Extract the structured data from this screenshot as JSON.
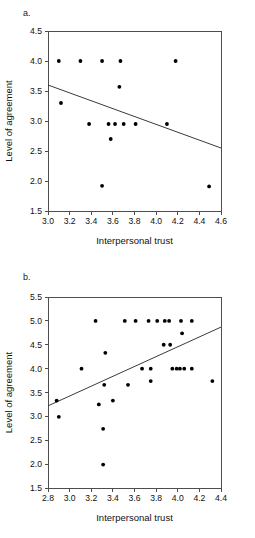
{
  "figure": {
    "panels": [
      {
        "label": "a.",
        "xlabel": "Interpersonal trust",
        "ylabel": "Level of agreement"
      },
      {
        "label": "b.",
        "xlabel": "Interpersonal trust",
        "ylabel": "Level of agreement"
      }
    ]
  },
  "chart_data": [
    {
      "type": "scatter",
      "title": "a.",
      "xlabel": "Interpersonal trust",
      "ylabel": "Level of agreement",
      "xlim": [
        3.0,
        4.6
      ],
      "ylim": [
        1.5,
        4.5
      ],
      "xticks": [
        "3.0",
        "3.2",
        "3.4",
        "3.6",
        "3.8",
        "4.0",
        "4.2",
        "4.4",
        "4.6"
      ],
      "yticks": [
        "1.5",
        "2.0",
        "2.5",
        "3.0",
        "3.5",
        "4.0",
        "4.5"
      ],
      "xtick_values": [
        3.0,
        3.2,
        3.4,
        3.6,
        3.8,
        4.0,
        4.2,
        4.4,
        4.6
      ],
      "ytick_values": [
        1.5,
        2.0,
        2.5,
        3.0,
        3.5,
        4.0,
        4.5
      ],
      "grid": false,
      "legend": false,
      "points": [
        [
          3.1,
          4.0
        ],
        [
          3.3,
          4.0
        ],
        [
          3.5,
          4.0
        ],
        [
          3.67,
          4.0
        ],
        [
          4.18,
          4.0
        ],
        [
          3.66,
          3.57
        ],
        [
          3.12,
          3.3
        ],
        [
          3.38,
          2.95
        ],
        [
          3.56,
          2.95
        ],
        [
          3.62,
          2.95
        ],
        [
          3.7,
          2.95
        ],
        [
          3.81,
          2.95
        ],
        [
          4.1,
          2.95
        ],
        [
          3.58,
          2.7
        ],
        [
          3.5,
          1.92
        ],
        [
          4.49,
          1.91
        ]
      ],
      "trend_line": {
        "x0": 3.0,
        "y0": 3.6,
        "x1": 4.6,
        "y1": 2.55,
        "slope": -0.656,
        "direction": "negative"
      }
    },
    {
      "type": "scatter",
      "title": "b.",
      "xlabel": "Interpersonal trust",
      "ylabel": "Level of agreement",
      "xlim": [
        2.8,
        4.4
      ],
      "ylim": [
        1.5,
        5.5
      ],
      "xticks": [
        "2.8",
        "3.0",
        "3.2",
        "3.4",
        "3.6",
        "3.8",
        "4.0",
        "4.2",
        "4.4"
      ],
      "yticks": [
        "1.5",
        "2.0",
        "2.5",
        "3.0",
        "3.5",
        "4.0",
        "4.5",
        "5.0",
        "5.5"
      ],
      "xtick_values": [
        2.8,
        3.0,
        3.2,
        3.4,
        3.6,
        3.8,
        4.0,
        4.2,
        4.4
      ],
      "ytick_values": [
        1.5,
        2.0,
        2.5,
        3.0,
        3.5,
        4.0,
        4.5,
        5.0,
        5.5
      ],
      "grid": false,
      "legend": false,
      "points": [
        [
          3.24,
          5.0
        ],
        [
          3.51,
          5.0
        ],
        [
          3.61,
          5.0
        ],
        [
          3.73,
          5.0
        ],
        [
          3.81,
          5.0
        ],
        [
          3.88,
          5.0
        ],
        [
          3.92,
          5.0
        ],
        [
          4.03,
          5.0
        ],
        [
          4.13,
          5.0
        ],
        [
          4.04,
          4.74
        ],
        [
          3.87,
          4.5
        ],
        [
          3.93,
          4.5
        ],
        [
          3.33,
          4.33
        ],
        [
          3.11,
          4.0
        ],
        [
          3.67,
          4.0
        ],
        [
          3.75,
          4.0
        ],
        [
          3.95,
          4.0
        ],
        [
          3.99,
          4.0
        ],
        [
          4.02,
          4.0
        ],
        [
          4.06,
          4.0
        ],
        [
          4.13,
          4.0
        ],
        [
          3.75,
          3.74
        ],
        [
          4.32,
          3.74
        ],
        [
          3.32,
          3.66
        ],
        [
          3.54,
          3.66
        ],
        [
          2.88,
          3.33
        ],
        [
          3.4,
          3.33
        ],
        [
          3.27,
          3.25
        ],
        [
          2.9,
          2.99
        ],
        [
          3.31,
          2.74
        ],
        [
          3.31,
          1.99
        ]
      ],
      "trend_line": {
        "x0": 2.8,
        "y0": 3.22,
        "x1": 4.4,
        "y1": 4.87,
        "slope": 1.031,
        "direction": "positive"
      }
    }
  ]
}
